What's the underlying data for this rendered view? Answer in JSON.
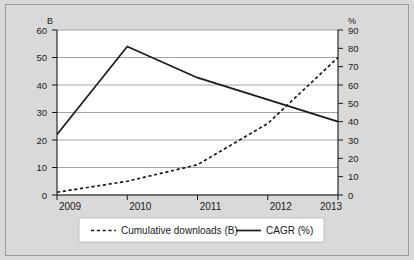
{
  "chart_data": {
    "type": "line",
    "title": "",
    "xlabel": "",
    "categories": [
      "2009",
      "2010",
      "2011",
      "2012",
      "2013"
    ],
    "left_axis": {
      "unit": "B",
      "label": "B",
      "min": 0,
      "max": 60,
      "step": 10,
      "ticks": [
        "0",
        "10",
        "20",
        "30",
        "40",
        "50",
        "60"
      ]
    },
    "right_axis": {
      "unit": "%",
      "label": "%",
      "min": 0,
      "max": 90,
      "step": 10,
      "ticks": [
        "0",
        "10",
        "20",
        "30",
        "40",
        "50",
        "60",
        "70",
        "80",
        "90"
      ]
    },
    "grid": true,
    "legend_position": "bottom",
    "series": [
      {
        "name": "Cumulative downloads (B)",
        "axis": "left",
        "style": "dashed",
        "color": "#1a1a1a",
        "values": [
          1,
          5,
          11,
          26,
          50
        ]
      },
      {
        "name": "CAGR (%)",
        "axis": "right",
        "style": "solid",
        "color": "#1a1a1a",
        "values": [
          33,
          81,
          64,
          52,
          40
        ]
      }
    ]
  },
  "legend": {
    "items": [
      {
        "label": "Cumulative downloads (B)",
        "style": "dashed"
      },
      {
        "label": "CAGR (%)",
        "style": "solid"
      }
    ]
  },
  "colors": {
    "background": "#d9d9d9",
    "plot_area": "#ffffff",
    "grid": "#9a9a9a",
    "axis": "#1a1a1a",
    "line": "#1a1a1a",
    "legend_background": "#ffffff"
  }
}
